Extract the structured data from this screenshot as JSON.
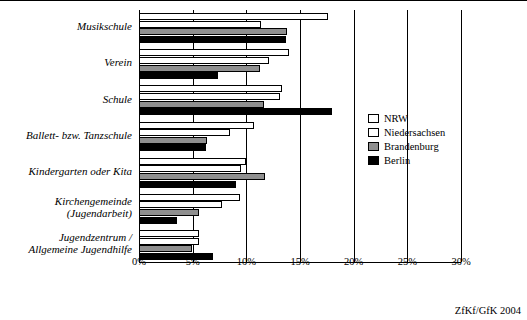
{
  "source_note": "ZfKf/GfK 2004",
  "legend": {
    "items": [
      {
        "label": "NRW",
        "color": "#ffffff"
      },
      {
        "label": "Niedersachsen",
        "color": "#ffffff"
      },
      {
        "label": "Brandenburg",
        "color": "#8f8f8f"
      },
      {
        "label": "Berlin",
        "color": "#000000"
      }
    ]
  },
  "chart_data": {
    "type": "bar",
    "orientation": "horizontal",
    "title": "",
    "xlabel": "",
    "ylabel": "",
    "xlim": [
      0,
      30
    ],
    "xtick_labels": [
      "0%",
      "5%",
      "10%",
      "15%",
      "20%",
      "25%",
      "30%"
    ],
    "xticks": [
      0,
      5,
      10,
      15,
      20,
      25,
      30
    ],
    "grid": true,
    "legend_position": "right",
    "categories": [
      "Musikschule",
      "Verein",
      "Schule",
      "Ballett- bzw. Tanzschule",
      "Kindergarten oder Kita",
      "Kirchengemeinde\n(Jugendarbeit)",
      "Jugendzentrum /\nAllgemeine Jugendhilfe"
    ],
    "category_lines": [
      [
        "Musikschule"
      ],
      [
        "Verein"
      ],
      [
        "Schule"
      ],
      [
        "Ballett- bzw. Tanzschule"
      ],
      [
        "Kindergarten oder Kita"
      ],
      [
        "Kirchengemeinde",
        "(Jugendarbeit)"
      ],
      [
        "Jugendzentrum /",
        "Allgemeine Jugendhilfe"
      ]
    ],
    "series": [
      {
        "name": "NRW",
        "color": "#ffffff",
        "values": [
          17.6,
          14.0,
          13.3,
          10.7,
          10.0,
          9.4,
          5.6
        ]
      },
      {
        "name": "Niedersachsen",
        "color": "#ffffff",
        "values": [
          11.4,
          12.1,
          13.1,
          8.5,
          9.5,
          7.7,
          5.6
        ]
      },
      {
        "name": "Brandenburg",
        "color": "#8f8f8f",
        "values": [
          13.8,
          11.3,
          11.6,
          6.3,
          11.7,
          5.6,
          4.9
        ]
      },
      {
        "name": "Berlin",
        "color": "#000000",
        "values": [
          13.7,
          7.4,
          18.0,
          6.2,
          9.0,
          3.5,
          6.9
        ]
      }
    ]
  }
}
